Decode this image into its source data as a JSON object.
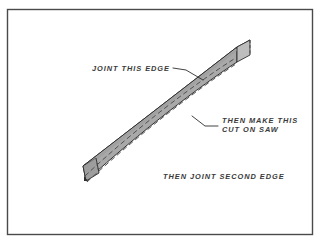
{
  "figure": {
    "background_color": "#ffffff",
    "frame": {
      "name": "illustration-border",
      "color": "#4a4a4a",
      "x": 7,
      "y": 9,
      "width": 306,
      "height": 226
    }
  },
  "annotations": [
    {
      "id": "joint-this-edge",
      "text": "JOINT THIS EDGE",
      "x": 92,
      "y": 71,
      "leader": "M 173,68 L 186,70 L 203,80",
      "points_to": "top-edge-of-board"
    },
    {
      "id": "then-make-this-cut-on-saw",
      "line1": "THEN MAKE THIS",
      "line2": "CUT ON SAW",
      "x": 222,
      "y": 123,
      "y2": 132,
      "leader": "M 218,126 L 205,126 L 192,116",
      "points_to": "dashed-saw-cut-line"
    },
    {
      "id": "then-joint-second-edge",
      "text": "THEN JOINT SECOND EDGE",
      "x": 163,
      "y": 179,
      "points_to": "bottom-edge-of-board"
    }
  ],
  "board": {
    "name": "bowed-board",
    "face_color": "#a9a9a9",
    "top_face_color": "#c6c6c6",
    "end_face_color": "#b8b8b8",
    "outline_color": "#2e2e2e",
    "cut_line_color": "#4c4c4c",
    "cut_line_style": "dashed",
    "description": "Long board shown in isometric view, straight jointed top edge and a bowed (curved) bottom edge, with two dashed curved lines across the face indicating the saw cut"
  }
}
